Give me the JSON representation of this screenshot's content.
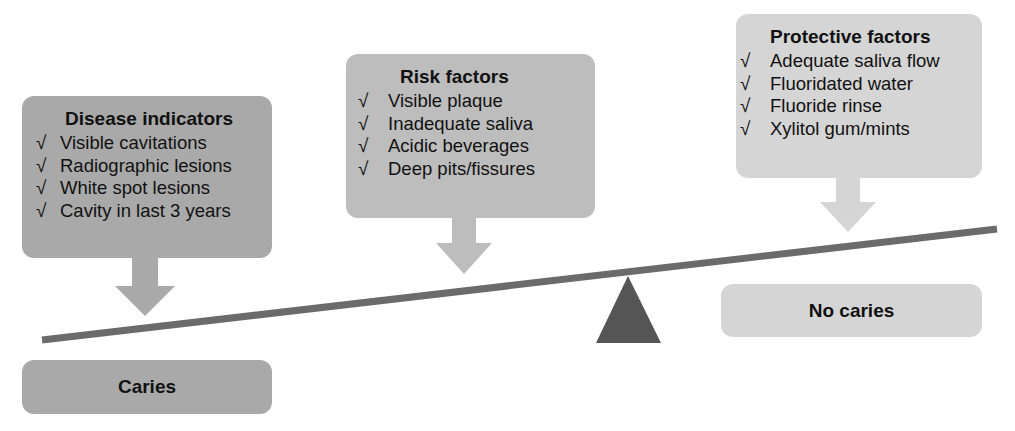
{
  "diagram": {
    "type": "balance-scale",
    "colors": {
      "disease_box": "#a9a9a9",
      "risk_box": "#bdbdbd",
      "protective_box": "#d5d5d5",
      "caries_box": "#a9a9a9",
      "no_caries_box": "#d5d5d5",
      "beam": "#6b6b6b",
      "fulcrum": "#555555",
      "text": "#111111"
    },
    "check_glyph": "√",
    "disease_indicators": {
      "title": "Disease indicators",
      "items": [
        "Visible cavitations",
        "Radiographic lesions",
        "White spot lesions",
        "Cavity in last 3 years"
      ]
    },
    "risk_factors": {
      "title": "Risk factors",
      "items": [
        "Visible plaque",
        "Inadequate saliva",
        "Acidic beverages",
        "Deep pits/fissures"
      ]
    },
    "protective_factors": {
      "title": "Protective factors",
      "items": [
        "Adequate saliva flow",
        "Fluoridated water",
        "Fluoride rinse",
        "Xylitol gum/mints"
      ]
    },
    "outcomes": {
      "left": "Caries",
      "right": "No caries"
    }
  }
}
